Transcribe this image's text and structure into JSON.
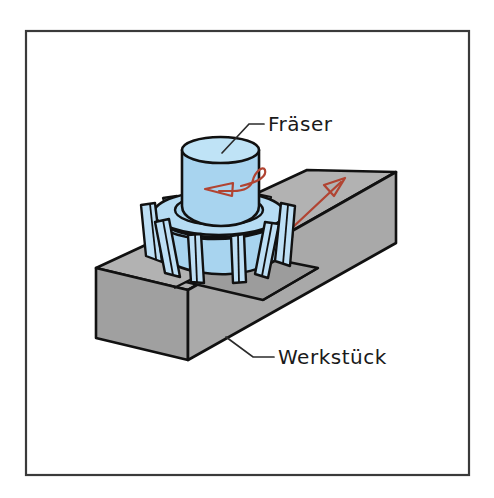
{
  "figure": {
    "frame": {
      "border_color": "#3a3a3a",
      "background_color": "#ffffff"
    },
    "colors": {
      "workpiece_top": "#b0b0b0",
      "workpiece_front": "#a3a3a3",
      "workpiece_end": "#9a9a9a",
      "workpiece_slot": "#9e9e9e",
      "cutter_blue": "#a8d4ef",
      "cutter_blue_light": "#bfe0f5",
      "cutter_blue_dark": "#8fc4e6",
      "outline": "#111111",
      "arrow_red": "#b14432",
      "label_text": "#1a1a1a",
      "leader_line": "#2b2b2b"
    },
    "labels": [
      {
        "id": "cutter-label",
        "name": "Fräser",
        "text": "Fräser",
        "x": 268,
        "y": 131
      },
      {
        "id": "workpiece-label",
        "name": "Werkstück",
        "text": "Werkstück",
        "x": 278,
        "y": 363
      }
    ],
    "annotations": [
      {
        "id": "rotation-arrow",
        "name": "rotation-direction-arrow",
        "meaning": "Schnittbewegung / Drehrichtung",
        "color": "#b14432"
      },
      {
        "id": "feed-arrow",
        "name": "feed-direction-arrow",
        "meaning": "Vorschubrichtung",
        "color": "#b14432"
      }
    ],
    "parts": [
      {
        "id": "cutter",
        "name": "Fräser",
        "description": "Walzenstirnfräser mit Schneidzähnen",
        "color": "#a8d4ef"
      },
      {
        "id": "workpiece",
        "name": "Werkstück",
        "description": "Rechteckiger Block mit gefräster Nut",
        "color": "#a8a8a8"
      }
    ]
  }
}
